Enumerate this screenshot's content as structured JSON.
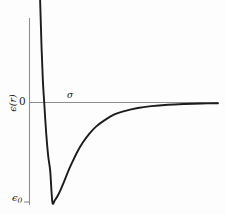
{
  "figure": {
    "background_color": "#fdfdfd",
    "curve_color": "#1c1c1c",
    "axis_color": "#8e8e8e"
  },
  "labels": {
    "y_axis": "ϵ(r)",
    "zero": "0",
    "sigma": "σ",
    "epsilon_zero_symbol": "ϵ",
    "epsilon_zero_subscript": "0"
  },
  "chart_data": {
    "type": "line",
    "title": "",
    "xlabel": "",
    "ylabel": "ϵ(r)",
    "grid": false,
    "legend": null,
    "annotations": [
      {
        "text": "σ",
        "meaning": "separation at which potential crosses zero",
        "x": 1.0,
        "y": 0.0
      },
      {
        "text": "ϵ₀",
        "meaning": "depth of the potential well (minimum value)",
        "x": 1.122,
        "y": -1.0
      },
      {
        "text": "0",
        "meaning": "zero level of the potential on the vertical axis",
        "x": 0.0,
        "y": 0.0
      }
    ],
    "axis_ticks": {
      "y": [
        {
          "value": 0.0,
          "label": "0"
        },
        {
          "value": -1.0,
          "label": "ϵ₀"
        }
      ],
      "x": []
    },
    "xlim": [
      0.78,
      3.6
    ],
    "ylim": [
      -1.12,
      2.4
    ],
    "series": [
      {
        "name": "Lennard-Jones 12-6 potential",
        "x": [
          0.88,
          0.9,
          0.92,
          0.94,
          0.96,
          0.98,
          1.0,
          1.03,
          1.06,
          1.09,
          1.122,
          1.16,
          1.2,
          1.25,
          1.3,
          1.36,
          1.42,
          1.5,
          1.58,
          1.68,
          1.78,
          1.9,
          2.05,
          2.2,
          2.4,
          2.6,
          2.85,
          3.1,
          3.35,
          3.6
        ],
        "y": [
          3.2,
          2.29,
          1.57,
          1.0,
          0.56,
          0.22,
          0.0,
          -0.31,
          -0.54,
          -0.69,
          -1.0,
          -0.98,
          -0.94,
          -0.87,
          -0.79,
          -0.69,
          -0.6,
          -0.49,
          -0.4,
          -0.31,
          -0.24,
          -0.18,
          -0.12,
          -0.086,
          -0.055,
          -0.037,
          -0.023,
          -0.015,
          -0.01,
          -0.007
        ]
      }
    ]
  }
}
